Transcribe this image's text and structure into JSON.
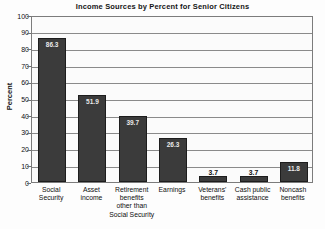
{
  "chart_data": {
    "type": "bar",
    "title": "Income Sources by Percent for Senior Citizens",
    "xlabel": "",
    "ylabel": "Percent",
    "ylim": [
      0,
      100
    ],
    "yticks": [
      0,
      10,
      20,
      30,
      40,
      50,
      60,
      70,
      80,
      90,
      100
    ],
    "grid": true,
    "legend": "none",
    "bar_color": "#3b3b3b",
    "categories": [
      "Social Security",
      "Asset income",
      "Retirement benefits other than Social Security",
      "Earnings",
      "Veterans' benefits",
      "Cash public assistance",
      "Noncash benefits"
    ],
    "category_lines": [
      [
        "Social",
        "Security"
      ],
      [
        "Asset",
        "income"
      ],
      [
        "Retirement",
        "benefits",
        "other than",
        "Social Security"
      ],
      [
        "Earnings"
      ],
      [
        "Veterans'",
        "benefits"
      ],
      [
        "Cash public",
        "assistance"
      ],
      [
        "Noncash",
        "benefits"
      ]
    ],
    "values": [
      86.3,
      51.9,
      39.7,
      26.3,
      3.7,
      3.7,
      11.8
    ],
    "value_labels": [
      "86.3",
      "51.9",
      "39.7",
      "26.3",
      "3.7",
      "3.7",
      "11.8"
    ],
    "label_placement": [
      "inside",
      "inside",
      "inside",
      "inside",
      "outside",
      "outside",
      "inside"
    ]
  }
}
